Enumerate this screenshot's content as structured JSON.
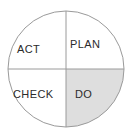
{
  "figure": {
    "name": "pdca-cycle-diagram",
    "shape": "circle-quadrants",
    "background_color": "#ffffff",
    "stroke_color": "#9a9a9a",
    "text_color": "#2b2b2b",
    "highlight_color": "#dedede",
    "geometry": {
      "center_x": 66,
      "center_y": 69,
      "radius": 58
    }
  },
  "quadrants": [
    {
      "id": "act",
      "label": "ACT",
      "position": "top-left",
      "shaded": false
    },
    {
      "id": "plan",
      "label": "PLAN",
      "position": "top-right",
      "shaded": false
    },
    {
      "id": "check",
      "label": "CHECK",
      "position": "bottom-left",
      "shaded": false
    },
    {
      "id": "do",
      "label": "DO",
      "position": "bottom-right",
      "shaded": true
    }
  ],
  "dividers": {
    "vertical": "vertical-divider",
    "horizontal": "horizontal-divider"
  }
}
